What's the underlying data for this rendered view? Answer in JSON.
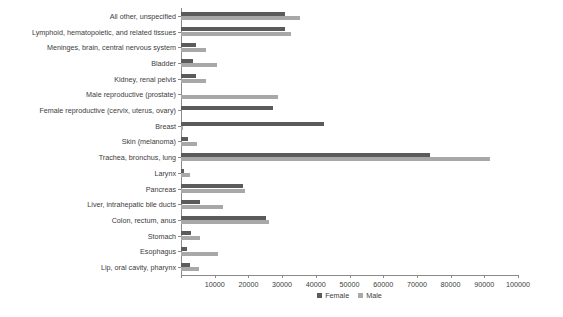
{
  "chart_data": {
    "type": "bar",
    "orientation": "horizontal",
    "title": "",
    "xlabel": "",
    "ylabel": "",
    "xlim": [
      0,
      100000
    ],
    "grid": false,
    "legend_position": "bottom-center",
    "xticks": [
      0,
      10000,
      20000,
      30000,
      40000,
      50000,
      60000,
      70000,
      80000,
      90000,
      100000
    ],
    "xtick_labels": [
      "",
      "10000",
      "20000",
      "30000",
      "40000",
      "50000",
      "60000",
      "70000",
      "80000",
      "90000",
      "100000"
    ],
    "categories": [
      "All other, unspecified",
      "Lymphoid, hematopoietic, and related tissues",
      "Meninges, brain, central nervous system",
      "Bladder",
      "Kidney, renal pelvis",
      "Male reproductive (prostate)",
      "Female reproductive (cervix, uterus, ovary)",
      "Breast",
      "Skin (melanoma)",
      "Trachea, bronchus, lung",
      "Larynx",
      "Pancreas",
      "Liver, intrahepatic bile ducts",
      "Colon, rectum, anus",
      "Stomach",
      "Esophagus",
      "Lip, oral cavity, pharynx"
    ],
    "series": [
      {
        "name": "Female",
        "color": "#5b5b5b",
        "values": [
          30900,
          30900,
          4400,
          3600,
          4400,
          0,
          27300,
          42400,
          2100,
          74000,
          800,
          18400,
          5700,
          25200,
          3000,
          1800,
          2700
        ]
      },
      {
        "name": "Male",
        "color": "#a8a8a8",
        "values": [
          35300,
          32700,
          7500,
          10700,
          7500,
          28800,
          0,
          500,
          4700,
          91700,
          2700,
          19000,
          12500,
          26100,
          5600,
          11000,
          5300
        ]
      }
    ]
  },
  "legend": {
    "items": [
      {
        "label": "Female",
        "color": "#5b5b5b"
      },
      {
        "label": "Male",
        "color": "#a8a8a8"
      }
    ]
  }
}
